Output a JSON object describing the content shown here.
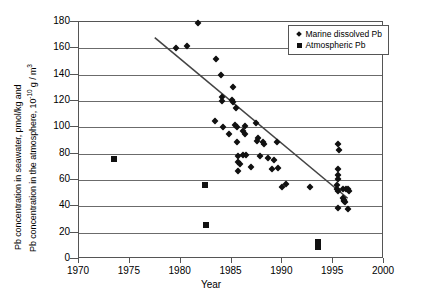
{
  "chart_data": {
    "type": "scatter",
    "title": "",
    "xlabel": "Year",
    "ylabel_line1": "Pb concentration in seawater, pmol/kg and",
    "ylabel_line2_pre": "Pb concentration in the atmosphere, 10",
    "ylabel_line2_sup": "-10",
    "ylabel_line2_post": " g / m",
    "ylabel_line2_sup2": "3",
    "xlim": [
      1970,
      2000
    ],
    "ylim": [
      0,
      180
    ],
    "xticks": [
      1970,
      1975,
      1980,
      1985,
      1990,
      1995,
      2000
    ],
    "yticks": [
      0,
      20,
      40,
      60,
      80,
      100,
      120,
      140,
      160,
      180
    ],
    "grid": "horizontal",
    "legend_position": "top-right",
    "marker_color": "#111111",
    "trendline": {
      "label": "linear trend",
      "x_start": 1977.5,
      "y_start": 168,
      "x_end": 1996.6,
      "y_end": 45,
      "color": "#444444"
    },
    "series": [
      {
        "name": "Marine dissolved Pb",
        "marker": "diamond",
        "points": [
          [
            1981.7,
            179
          ],
          [
            1979.5,
            160
          ],
          [
            1980.6,
            162
          ],
          [
            1983.5,
            152
          ],
          [
            1984.0,
            140
          ],
          [
            1985.1,
            131
          ],
          [
            1984.1,
            123
          ],
          [
            1984.1,
            120
          ],
          [
            1985.0,
            121
          ],
          [
            1985.1,
            119
          ],
          [
            1985.4,
            115
          ],
          [
            1983.4,
            105
          ],
          [
            1984.2,
            100
          ],
          [
            1985.3,
            102
          ],
          [
            1985.5,
            100
          ],
          [
            1986.3,
            101
          ],
          [
            1987.4,
            103
          ],
          [
            1984.8,
            95
          ],
          [
            1986.1,
            97
          ],
          [
            1986.3,
            95
          ],
          [
            1987.6,
            92
          ],
          [
            1987.5,
            90
          ],
          [
            1988.1,
            89
          ],
          [
            1988.2,
            87
          ],
          [
            1989.5,
            89
          ],
          [
            1985.5,
            89
          ],
          [
            1985.6,
            78
          ],
          [
            1986.1,
            79
          ],
          [
            1986.4,
            79
          ],
          [
            1987.8,
            78
          ],
          [
            1988.6,
            77
          ],
          [
            1985.6,
            74
          ],
          [
            1985.8,
            72
          ],
          [
            1986.9,
            70
          ],
          [
            1989.2,
            75
          ],
          [
            1989.0,
            68
          ],
          [
            1989.6,
            69
          ],
          [
            1985.6,
            67
          ],
          [
            1990.0,
            55
          ],
          [
            1990.4,
            57
          ],
          [
            1992.7,
            55
          ],
          [
            1995.5,
            87
          ],
          [
            1995.6,
            83
          ],
          [
            1995.5,
            68
          ],
          [
            1995.5,
            64
          ],
          [
            1995.5,
            61
          ],
          [
            1995.4,
            56
          ],
          [
            1995.4,
            53
          ],
          [
            1995.5,
            52
          ],
          [
            1996.0,
            53
          ],
          [
            1996.3,
            53
          ],
          [
            1996.5,
            53
          ],
          [
            1996.6,
            52
          ],
          [
            1996.0,
            46
          ],
          [
            1996.1,
            45
          ],
          [
            1996.1,
            44
          ],
          [
            1996.2,
            43
          ],
          [
            1995.5,
            39
          ],
          [
            1996.5,
            38
          ]
        ]
      },
      {
        "name": "Atmospheric Pb",
        "marker": "square",
        "points": [
          [
            1973.4,
            76
          ],
          [
            1982.4,
            56
          ],
          [
            1982.5,
            26
          ],
          [
            1993.5,
            13
          ],
          [
            1993.5,
            9
          ]
        ]
      }
    ]
  },
  "legend": {
    "items": [
      {
        "label": "Marine dissolved Pb",
        "marker": "diamond-marker-icon"
      },
      {
        "label": "Atmospheric Pb",
        "marker": "square-marker-icon"
      }
    ]
  }
}
